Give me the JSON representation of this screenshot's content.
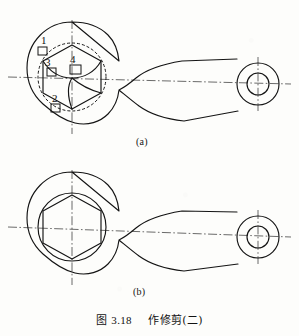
{
  "figure": {
    "caption_prefix": "图",
    "caption_number": "3.18",
    "caption_title": "作修剪(二)",
    "caption_full": "图 3.18  作修剪(二)",
    "subfigures": [
      {
        "id": "a",
        "label": "(a)",
        "description": "连杆大端六角孔修剪前，带虚线构造圆与四个拾取框"
      },
      {
        "id": "b",
        "label": "(b)",
        "description": "连杆大端六角孔修剪后"
      }
    ],
    "pick_marks": [
      {
        "id": "1",
        "label": "1",
        "x": 41,
        "y": 37
      },
      {
        "id": "2",
        "label": "2",
        "x": 49,
        "y": 96
      },
      {
        "id": "3",
        "label": "3",
        "x": 45,
        "y": 62
      },
      {
        "id": "4",
        "label": "4",
        "x": 70,
        "y": 57
      }
    ],
    "colors": {
      "ink": "#141414",
      "paper": "#fdfdfb",
      "centerline": "#1b1b1b",
      "dashed_construction": "#171717"
    },
    "linework": {
      "object_line_width": 1.15,
      "center_line_width": 0.65,
      "dash_pattern_construction": "3,2",
      "dash_pattern_center": "9,2.4,1.6,2.4"
    },
    "geometry": {
      "view_a": {
        "big_end_center_x": 72,
        "big_end_center_y": 77,
        "small_end_center_x": 258,
        "small_end_center_y": 84
      },
      "view_b": {
        "big_end_center_x": 72,
        "big_end_center_y": 227,
        "small_end_center_x": 258,
        "small_end_center_y": 237
      },
      "hex_radius": 33,
      "construction_circle_radius": 34,
      "small_end_outer_radius": 21,
      "small_end_inner_radius": 11
    }
  }
}
